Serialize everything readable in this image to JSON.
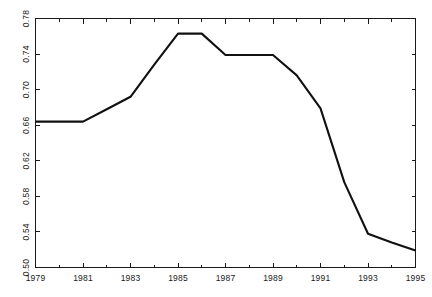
{
  "chart_data": {
    "type": "line",
    "title": "",
    "subtitle": "",
    "xlabel": "",
    "ylabel": "",
    "xlim": [
      1979,
      1995
    ],
    "ylim": [
      0.5,
      0.78
    ],
    "grid": false,
    "legend": null,
    "x_tick_labels": [
      "1979",
      "1981",
      "1983",
      "1985",
      "1987",
      "1989",
      "1991",
      "1993",
      "1995"
    ],
    "x_ticks": [
      1979,
      1981,
      1983,
      1985,
      1987,
      1989,
      1991,
      1993,
      1995
    ],
    "x_minor_ticks": [
      1980,
      1982,
      1984,
      1986,
      1988,
      1990,
      1992,
      1994
    ],
    "y_tick_labels": [
      "0.50",
      "0.54",
      "0.58",
      "0.62",
      "0.66",
      "0.70",
      "0.74",
      "0.78"
    ],
    "y_ticks": [
      0.5,
      0.54,
      0.58,
      0.62,
      0.66,
      0.7,
      0.74,
      0.78
    ],
    "series": [
      {
        "name": "series-1",
        "color": "#111111",
        "x": [
          1979,
          1980,
          1981,
          1982,
          1983,
          1984,
          1985,
          1986,
          1987,
          1988,
          1989,
          1990,
          1991,
          1992,
          1993,
          1994,
          1995
        ],
        "values": [
          0.664,
          0.664,
          0.664,
          0.678,
          0.692,
          0.728,
          0.763,
          0.763,
          0.739,
          0.739,
          0.739,
          0.716,
          0.679,
          0.596,
          0.538,
          0.528,
          0.519
        ]
      }
    ]
  },
  "axes": {
    "frame_color": "#1a1a1a",
    "background": "#ffffff"
  }
}
